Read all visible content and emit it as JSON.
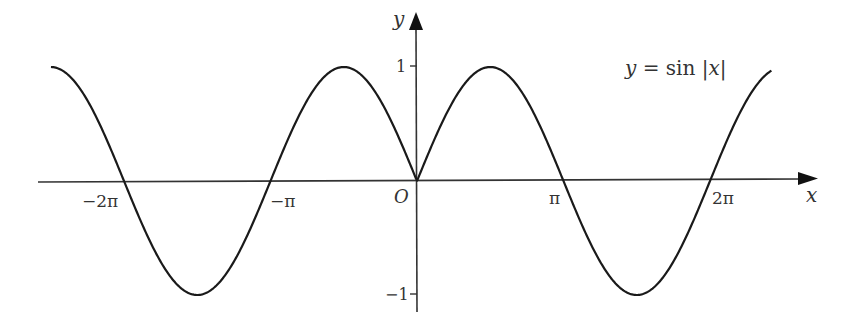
{
  "chart_data": {
    "type": "line",
    "title": "",
    "function_label": "y = sin |x|",
    "xlabel": "x",
    "ylabel": "y",
    "origin_label": "O",
    "x_ticks": [
      {
        "value": -6.2832,
        "label": "−2π"
      },
      {
        "value": -3.1416,
        "label": "−π"
      },
      {
        "value": 3.1416,
        "label": "π"
      },
      {
        "value": 6.2832,
        "label": "2π"
      }
    ],
    "y_ticks": [
      {
        "value": 1,
        "label": "1"
      },
      {
        "value": -1,
        "label": "−1"
      }
    ],
    "xlim": [
      -8.0,
      7.7
    ],
    "ylim": [
      -1.1,
      1.1
    ],
    "grid": false,
    "legend": "none",
    "series": [
      {
        "name": "y = sin|x|",
        "x": [
          -7.85,
          -7.07,
          -6.28,
          -5.5,
          -4.71,
          -3.93,
          -3.14,
          -2.36,
          -1.57,
          -0.79,
          0,
          0.79,
          1.57,
          2.36,
          3.14,
          3.93,
          4.71,
          5.5,
          6.28,
          7.07,
          7.85
        ],
        "y": [
          1.0,
          0.71,
          0,
          -0.71,
          -1.0,
          -0.71,
          0,
          0.71,
          1.0,
          0.71,
          0,
          0.71,
          1.0,
          0.71,
          0,
          -0.71,
          -1.0,
          -0.71,
          0,
          0.71,
          1.0
        ]
      }
    ],
    "curve_domain": [
      -7.85,
      7.6
    ]
  },
  "colors": {
    "curve": "#1a1a1a",
    "axis": "#333333",
    "text": "#333333",
    "background": "#ffffff"
  }
}
